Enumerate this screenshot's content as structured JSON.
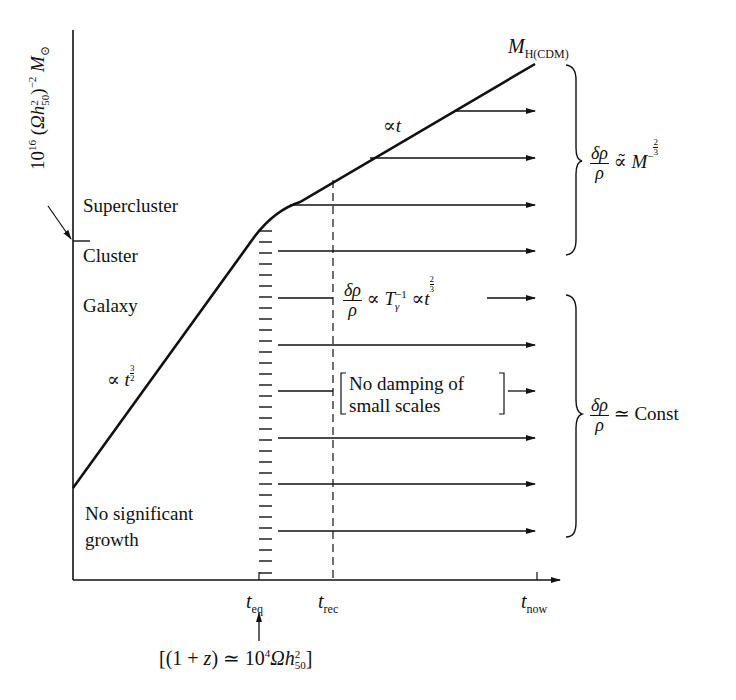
{
  "figure": {
    "y_axis_label": {
      "base": "10",
      "exp": "16",
      "paren_open": " (",
      "omega_h": "Ωh",
      "h_sup": "2",
      "h_sub": "50",
      "paren_close": ")",
      "exp2": "−2",
      "m": " M",
      "m_sub": "⊙"
    },
    "curve_top_label": {
      "m": "M",
      "sub": "H(CDM)"
    },
    "scale_labels": {
      "supercluster": "Supercluster",
      "cluster": "Cluster",
      "galaxy": "Galaxy",
      "no_growth_line1": "No significant",
      "no_growth_line2": "growth"
    },
    "slope_labels": {
      "steep": {
        "prop": "∝ ",
        "t": "t",
        "num": "3",
        "den": "2"
      },
      "shallow": {
        "prop": "∝",
        "t": "t"
      }
    },
    "mid_equation": {
      "num": "δρ",
      "den": "ρ",
      "prop1": " ∝ ",
      "T": "T",
      "T_sup": "−1",
      "T_sub": "γ",
      "prop2": "  ∝",
      "t": "t",
      "exp_num": "2",
      "exp_den": "3"
    },
    "damping_note": {
      "line1": "No damping of",
      "line2": "small scales"
    },
    "brace_upper_equation": {
      "num": "δρ",
      "den": "ρ",
      "rel": " ∝̃ ",
      "m": "M",
      "exp": "−",
      "exp_num": "2",
      "exp_den": "3"
    },
    "brace_lower_equation": {
      "num": "δρ",
      "den": "ρ",
      "rel": " ≃ Const"
    },
    "x_ticks": {
      "t_eq": {
        "t": "t",
        "sub": "eq"
      },
      "t_rec": {
        "t": "t",
        "sub": "rec"
      },
      "t_now": {
        "t": "t",
        "sub": "now"
      }
    },
    "t_eq_note": {
      "pre": "[(1 + ",
      "z": "z",
      "mid": ") ≃ 10",
      "exp": "4",
      "omega": "Ωh",
      "h_sup": "2",
      "h_sub": "50",
      "post": "]"
    }
  }
}
